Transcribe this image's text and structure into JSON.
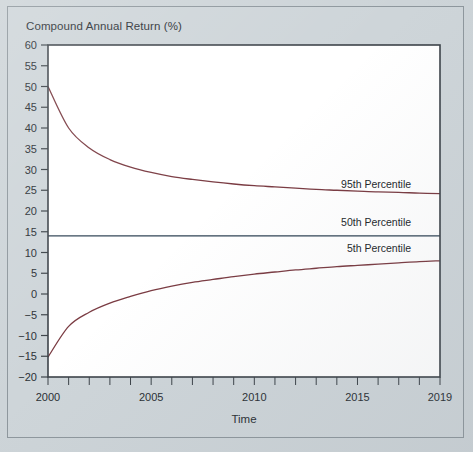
{
  "figure": {
    "background_color": "#ced5d9",
    "plot_background_color": "#ffffff",
    "border_color": "#8e979d",
    "axis_color": "#3c4349"
  },
  "chart_data": {
    "type": "line",
    "title": "Compound Annual Return (%)",
    "xlabel": "Time",
    "ylabel": "Compound Annual Return (%)",
    "xlim": [
      2000,
      2019
    ],
    "ylim": [
      -20,
      60
    ],
    "grid": false,
    "legend_position": "inline-right",
    "x_tick_labels": [
      "2000",
      "2005",
      "2010",
      "2015",
      "2019"
    ],
    "x_tick_values": [
      2000,
      2005,
      2010,
      2015,
      2019
    ],
    "x_minor_ticks": [
      2000,
      2001,
      2002,
      2003,
      2004,
      2005,
      2006,
      2007,
      2008,
      2009,
      2010,
      2011,
      2012,
      2013,
      2014,
      2015,
      2016,
      2017,
      2018,
      2019
    ],
    "y_tick_labels": [
      "60",
      "55",
      "50",
      "45",
      "40",
      "35",
      "30",
      "25",
      "20",
      "15",
      "10",
      "5",
      "0",
      "−5",
      "−10",
      "−15",
      "−20"
    ],
    "y_tick_values": [
      60,
      55,
      50,
      45,
      40,
      35,
      30,
      25,
      20,
      15,
      10,
      5,
      0,
      -5,
      -10,
      -15,
      -20
    ],
    "x": [
      2000,
      2001,
      2002,
      2003,
      2004,
      2005,
      2006,
      2007,
      2008,
      2009,
      2010,
      2011,
      2012,
      2013,
      2014,
      2015,
      2016,
      2017,
      2018,
      2019
    ],
    "series": [
      {
        "name": "95th Percentile",
        "color": "#7a3b42",
        "label": "95th Percentile",
        "label_x": 2017.6,
        "label_y": 25.6,
        "values": [
          50.0,
          40.0,
          35.2,
          32.4,
          30.6,
          29.3,
          28.3,
          27.6,
          27.0,
          26.5,
          26.1,
          25.8,
          25.5,
          25.2,
          25.0,
          24.8,
          24.6,
          24.5,
          24.3,
          24.2
        ]
      },
      {
        "name": "50th Percentile",
        "color": "#2f4355",
        "label": "50th Percentile",
        "label_x": 2017.6,
        "label_y": 16.4,
        "values": [
          14.0,
          14.0,
          14.0,
          14.0,
          14.0,
          14.0,
          14.0,
          14.0,
          14.0,
          14.0,
          14.0,
          14.0,
          14.0,
          14.0,
          14.0,
          14.0,
          14.0,
          14.0,
          14.0,
          14.0
        ]
      },
      {
        "name": "5th Percentile",
        "color": "#7a3b42",
        "label": "5th Percentile",
        "label_x": 2017.6,
        "label_y": 10.2,
        "values": [
          -15.2,
          -7.8,
          -4.4,
          -2.2,
          -0.6,
          0.8,
          1.9,
          2.8,
          3.5,
          4.2,
          4.8,
          5.3,
          5.8,
          6.2,
          6.6,
          6.9,
          7.2,
          7.5,
          7.8,
          8.0
        ]
      }
    ]
  }
}
